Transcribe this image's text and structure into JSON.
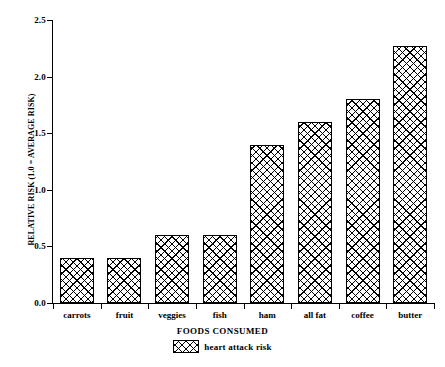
{
  "chart_data": {
    "type": "bar",
    "title": "",
    "xlabel": "FOODS CONSUMED",
    "ylabel": "RELATIVE RISK (1.0 = AVERAGE RISK)",
    "categories": [
      "carrots",
      "fruit",
      "veggies",
      "fish",
      "ham",
      "all fat",
      "coffee",
      "butter"
    ],
    "series": [
      {
        "name": "heart attack risk",
        "values": [
          0.4,
          0.4,
          0.6,
          0.6,
          1.4,
          1.6,
          1.8,
          2.27
        ]
      }
    ],
    "ylim": [
      0.0,
      2.5
    ],
    "ytick_labels": [
      "0.0",
      "0.5",
      "1.0",
      "1.5",
      "2.0",
      "2.5"
    ],
    "ytick_values": [
      0.0,
      0.5,
      1.0,
      1.5,
      2.0,
      2.5
    ],
    "grid": false,
    "legend_position": "bottom",
    "bar_color": "#ffffff",
    "bar_edge_color": "#000000",
    "bar_pattern": "cross-hatch"
  }
}
